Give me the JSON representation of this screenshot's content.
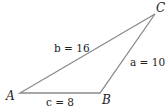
{
  "diagram": {
    "type": "triangle",
    "line_color": "#8a8a8a",
    "vertices": [
      {
        "name": "A",
        "label": "A",
        "x": 20,
        "y": 93
      },
      {
        "name": "B",
        "label": "B",
        "x": 100,
        "y": 93
      },
      {
        "name": "C",
        "label": "C",
        "x": 155,
        "y": 14
      }
    ],
    "sides": [
      {
        "name": "b",
        "label": "b = 16",
        "between": [
          "A",
          "C"
        ]
      },
      {
        "name": "a",
        "label": "a = 10",
        "between": [
          "B",
          "C"
        ]
      },
      {
        "name": "c",
        "label": "c = 8",
        "between": [
          "A",
          "B"
        ]
      }
    ]
  }
}
